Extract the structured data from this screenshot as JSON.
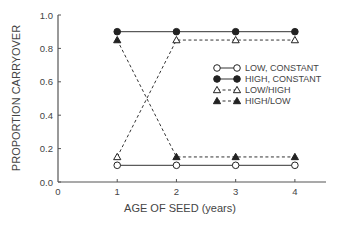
{
  "chart_data": {
    "type": "line",
    "title": "",
    "xlabel": "AGE OF SEED (years)",
    "ylabel": "PROPORTION CARRYOVER",
    "xlim": [
      0,
      4.5
    ],
    "ylim": [
      0,
      1.0
    ],
    "xticks": [
      0,
      1,
      2,
      3,
      4
    ],
    "xtick_labels": [
      "0",
      "1",
      "2",
      "3",
      "4"
    ],
    "yticks": [
      0.0,
      0.2,
      0.4,
      0.6,
      0.8,
      1.0
    ],
    "ytick_labels": [
      "0.0",
      "0.2",
      "0.4",
      "0.6",
      "0.8",
      "1.0"
    ],
    "grid": false,
    "legend_position": "center-right",
    "x": [
      1,
      2,
      3,
      4
    ],
    "series": [
      {
        "name": "LOW, CONSTANT",
        "values": [
          0.1,
          0.1,
          0.1,
          0.1
        ],
        "marker": "open-circle",
        "line": "solid"
      },
      {
        "name": "HIGH, CONSTANT",
        "values": [
          0.9,
          0.9,
          0.9,
          0.9
        ],
        "marker": "filled-circle",
        "line": "solid"
      },
      {
        "name": "LOW/HIGH",
        "values": [
          0.15,
          0.85,
          0.85,
          0.85
        ],
        "marker": "open-triangle",
        "line": "dashed"
      },
      {
        "name": "HIGH/LOW",
        "values": [
          0.85,
          0.15,
          0.15,
          0.15
        ],
        "marker": "filled-triangle",
        "line": "dashed"
      }
    ]
  }
}
